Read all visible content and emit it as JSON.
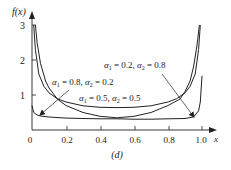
{
  "chart_data": {
    "type": "line",
    "title": "",
    "caption": "(d)",
    "xlabel": "x",
    "ylabel": "f(x)",
    "xlim": [
      0,
      1.0
    ],
    "ylim": [
      0,
      3
    ],
    "x_ticks": [
      "0",
      "0.2",
      "0.4",
      "0.6",
      "0.8",
      "1.0"
    ],
    "y_ticks": [
      "1",
      "2",
      "3"
    ],
    "grid": false,
    "legend": "annotations",
    "series": [
      {
        "name": "α1 = 0.8, α2 = 0.2",
        "x": [
          0.0,
          0.01,
          0.03,
          0.05,
          0.1,
          0.2,
          0.3,
          0.4,
          0.5,
          0.6,
          0.7,
          0.8,
          0.9,
          0.95,
          0.98,
          0.99,
          1.0
        ],
        "y": [
          0.7,
          0.5,
          0.43,
          0.4,
          0.37,
          0.34,
          0.33,
          0.32,
          0.32,
          0.31,
          0.31,
          0.32,
          0.33,
          0.37,
          0.55,
          0.8,
          1.55
        ]
      },
      {
        "name": "α1 = 0.5, α2 = 0.5",
        "x": [
          0.01,
          0.02,
          0.04,
          0.07,
          0.1,
          0.15,
          0.2,
          0.3,
          0.4,
          0.5,
          0.6,
          0.7,
          0.8,
          0.85,
          0.9,
          0.93,
          0.96,
          0.98,
          0.99
        ],
        "y": [
          3.0,
          2.3,
          1.6,
          1.25,
          1.06,
          0.89,
          0.8,
          0.69,
          0.65,
          0.64,
          0.65,
          0.69,
          0.8,
          0.89,
          1.06,
          1.25,
          1.6,
          2.3,
          3.0
        ]
      },
      {
        "name": "α1 = 0.2, α2 = 0.8",
        "x": [
          0.02,
          0.03,
          0.05,
          0.08,
          0.1,
          0.15,
          0.2,
          0.3,
          0.4,
          0.5,
          0.6,
          0.7,
          0.8,
          0.87,
          0.9,
          0.93,
          0.95,
          0.97,
          0.985
        ],
        "y": [
          3.0,
          2.5,
          1.9,
          1.4,
          1.2,
          0.88,
          0.7,
          0.5,
          0.39,
          0.35,
          0.39,
          0.5,
          0.7,
          0.88,
          1.1,
          1.4,
          1.8,
          2.4,
          3.0
        ]
      }
    ],
    "annotations": [
      {
        "text_a1": "α",
        "sub1": "1",
        "eq1": " = 0.2, ",
        "text_a2": "α",
        "sub2": "2",
        "eq2": " = 0.8",
        "label": "α1 = 0.2, α2 = 0.8"
      },
      {
        "text_a1": "α",
        "sub1": "1",
        "eq1": " = 0.8, ",
        "text_a2": "α",
        "sub2": "2",
        "eq2": " = 0.2",
        "label": "α1 = 0.8, α2 = 0.2"
      },
      {
        "text_a1": "α",
        "sub1": "1",
        "eq1": " = 0.5, ",
        "text_a2": "α",
        "sub2": "2",
        "eq2": " = 0.5",
        "label": "α1 = 0.5, α2 = 0.5"
      }
    ]
  }
}
